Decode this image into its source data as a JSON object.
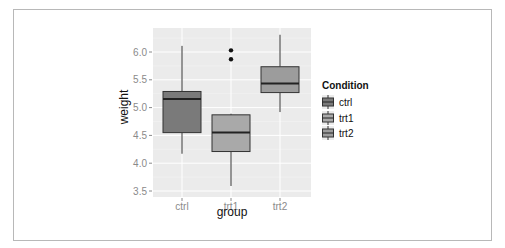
{
  "chart_data": {
    "type": "boxplot",
    "title": "",
    "xlabel": "group",
    "ylabel": "weight",
    "categories": [
      "ctrl",
      "trt1",
      "trt2"
    ],
    "yticks": [
      "3.5",
      "4.0",
      "4.5",
      "5.0",
      "5.5",
      "6.0"
    ],
    "ylim": [
      3.4,
      6.45
    ],
    "grid": true,
    "legend": {
      "title": "Condition",
      "position": "right",
      "entries": [
        "ctrl",
        "trt1",
        "trt2"
      ]
    },
    "series": [
      {
        "name": "ctrl",
        "whisker_low": 4.17,
        "q1": 4.55,
        "median": 5.155,
        "q3": 5.29,
        "whisker_high": 6.11,
        "outliers": [],
        "fill": "#7a7a7a"
      },
      {
        "name": "trt1",
        "whisker_low": 3.59,
        "q1": 4.21,
        "median": 4.55,
        "q3": 4.87,
        "whisker_high": 4.89,
        "outliers": [
          5.87,
          6.03
        ],
        "fill": "#a9a9a9"
      },
      {
        "name": "trt2",
        "whisker_low": 4.92,
        "q1": 5.27,
        "median": 5.435,
        "q3": 5.735,
        "whisker_high": 6.31,
        "outliers": [],
        "fill": "#9c9c9c"
      }
    ]
  }
}
